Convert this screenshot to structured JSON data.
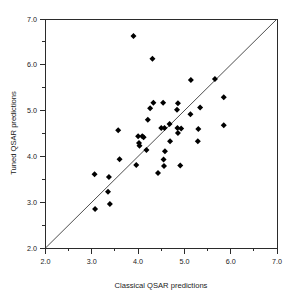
{
  "chart_data": {
    "type": "scatter",
    "title": "",
    "xlabel": "Classical QSAR predictions",
    "ylabel": "Tuned QSAR predictions",
    "xlim": [
      2.0,
      7.0
    ],
    "ylim": [
      2.0,
      7.0
    ],
    "grid": false,
    "legend": null,
    "xticks": [
      2.0,
      3.0,
      4.0,
      5.0,
      6.0,
      7.0
    ],
    "yticks": [
      2.0,
      3.0,
      4.0,
      5.0,
      6.0,
      7.0
    ],
    "xtick_labels": [
      "2.0",
      "3.0",
      "4.0",
      "5.0",
      "6.0",
      "7.0"
    ],
    "ytick_labels": [
      "2.0",
      "3.0",
      "4.0",
      "5.0",
      "6.0",
      "7.0"
    ],
    "minor_tick_interval": 0.5,
    "marker_style": "filled-diamond",
    "marker_color": "#000000",
    "reference_line": {
      "description": "identity line y = x",
      "from": [
        2.0,
        2.0
      ],
      "to": [
        7.0,
        7.0
      ],
      "color": "#3a3a3a"
    },
    "series": [
      {
        "name": "compounds",
        "points": [
          [
            3.9,
            6.63
          ],
          [
            4.31,
            6.13
          ],
          [
            5.14,
            5.67
          ],
          [
            5.66,
            5.69
          ],
          [
            5.85,
            5.29
          ],
          [
            4.33,
            5.17
          ],
          [
            4.54,
            5.17
          ],
          [
            4.86,
            5.16
          ],
          [
            5.34,
            5.07
          ],
          [
            4.26,
            5.05
          ],
          [
            4.84,
            5.02
          ],
          [
            5.13,
            4.92
          ],
          [
            4.21,
            4.8
          ],
          [
            4.68,
            4.71
          ],
          [
            3.57,
            4.57
          ],
          [
            4.5,
            4.62
          ],
          [
            4.57,
            4.62
          ],
          [
            4.85,
            4.62
          ],
          [
            4.93,
            4.61
          ],
          [
            5.3,
            4.6
          ],
          [
            4.86,
            4.51
          ],
          [
            5.85,
            4.68
          ],
          [
            4.0,
            4.44
          ],
          [
            4.09,
            4.44
          ],
          [
            4.12,
            4.42
          ],
          [
            4.02,
            4.29
          ],
          [
            4.03,
            4.23
          ],
          [
            4.69,
            4.33
          ],
          [
            5.29,
            4.33
          ],
          [
            4.18,
            4.14
          ],
          [
            4.58,
            4.11
          ],
          [
            3.6,
            3.94
          ],
          [
            4.55,
            3.93
          ],
          [
            3.96,
            3.81
          ],
          [
            4.56,
            3.79
          ],
          [
            4.91,
            3.8
          ],
          [
            4.43,
            3.64
          ],
          [
            3.06,
            3.61
          ],
          [
            3.37,
            3.55
          ],
          [
            3.35,
            3.23
          ],
          [
            3.39,
            2.96
          ],
          [
            3.07,
            2.85
          ]
        ]
      }
    ]
  },
  "axes": {
    "x_title": "Classical QSAR predictions",
    "y_title": "Tuned QSAR predictions"
  },
  "labels": {
    "x": [
      "2.0",
      "3.0",
      "4.0",
      "5.0",
      "6.0",
      "7.0"
    ],
    "y": [
      "2.0",
      "3.0",
      "4.0",
      "5.0",
      "6.0",
      "7.0"
    ]
  }
}
